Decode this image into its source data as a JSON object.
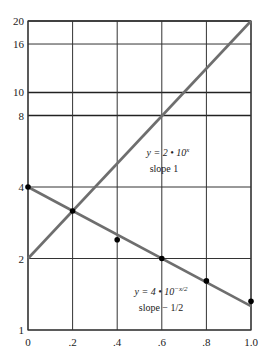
{
  "chart_data": {
    "type": "line",
    "title": "",
    "xlabel": "",
    "ylabel": "",
    "yscale": "log",
    "xlim": [
      0,
      1.0
    ],
    "ylim": [
      1,
      20
    ],
    "grid": true,
    "x_ticks": [
      {
        "value": 0,
        "label": "0"
      },
      {
        "value": 0.2,
        "label": ".2"
      },
      {
        "value": 0.4,
        "label": ".4"
      },
      {
        "value": 0.6,
        "label": ".6"
      },
      {
        "value": 0.8,
        "label": ".8"
      },
      {
        "value": 1.0,
        "label": "1.0"
      }
    ],
    "y_ticks": [
      {
        "value": 1,
        "label": "1",
        "major": false
      },
      {
        "value": 2,
        "label": "2",
        "major": false
      },
      {
        "value": 4,
        "label": "4",
        "major": false
      },
      {
        "value": 8,
        "label": "8",
        "major": true
      },
      {
        "value": 10,
        "label": "10",
        "major": true
      },
      {
        "value": 16,
        "label": "16",
        "major": false
      },
      {
        "value": 20,
        "label": "20",
        "major": true
      }
    ],
    "series": [
      {
        "name": "y = 2 · 10^x",
        "label_line1": "y = 2 • 10",
        "label_exp": "x",
        "label_line2": "slope 1",
        "x": [
          0,
          1.0
        ],
        "y": [
          2,
          20
        ],
        "color": "#6e6e6e"
      },
      {
        "name": "y = 4 · 10^(-x/2)",
        "label_line1": "y = 4 • 10",
        "label_exp": "−x/2",
        "label_line2": "slope − 1/2",
        "x": [
          0,
          1.0
        ],
        "y": [
          4,
          1.26
        ],
        "color": "#6e6e6e",
        "points": {
          "x": [
            0,
            0.2,
            0.4,
            0.6,
            0.8,
            1.0
          ],
          "y": [
            4.0,
            3.17,
            2.4,
            2.0,
            1.61,
            1.32
          ]
        }
      }
    ]
  }
}
